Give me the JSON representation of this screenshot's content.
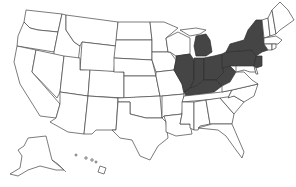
{
  "map": {
    "title": "United States",
    "highlight_color": "#454545",
    "outline_color": "#444444",
    "background": "#ffffff",
    "highlighted_states": [
      "Illinois",
      "Indiana",
      "Michigan",
      "Ohio",
      "Kentucky",
      "West Virginia",
      "Pennsylvania",
      "New York",
      "New Jersey"
    ],
    "states": [
      {
        "id": "WA",
        "name": "Washington",
        "highlighted": false
      },
      {
        "id": "OR",
        "name": "Oregon",
        "highlighted": false
      },
      {
        "id": "CA",
        "name": "California",
        "highlighted": false
      },
      {
        "id": "ID",
        "name": "Idaho",
        "highlighted": false
      },
      {
        "id": "NV",
        "name": "Nevada",
        "highlighted": false
      },
      {
        "id": "MT",
        "name": "Montana",
        "highlighted": false
      },
      {
        "id": "WY",
        "name": "Wyoming",
        "highlighted": false
      },
      {
        "id": "UT",
        "name": "Utah",
        "highlighted": false
      },
      {
        "id": "AZ",
        "name": "Arizona",
        "highlighted": false
      },
      {
        "id": "CO",
        "name": "Colorado",
        "highlighted": false
      },
      {
        "id": "NM",
        "name": "New Mexico",
        "highlighted": false
      },
      {
        "id": "ND",
        "name": "North Dakota",
        "highlighted": false
      },
      {
        "id": "SD",
        "name": "South Dakota",
        "highlighted": false
      },
      {
        "id": "NE",
        "name": "Nebraska",
        "highlighted": false
      },
      {
        "id": "KS",
        "name": "Kansas",
        "highlighted": false
      },
      {
        "id": "OK",
        "name": "Oklahoma",
        "highlighted": false
      },
      {
        "id": "TX",
        "name": "Texas",
        "highlighted": false
      },
      {
        "id": "MN",
        "name": "Minnesota",
        "highlighted": false
      },
      {
        "id": "IA",
        "name": "Iowa",
        "highlighted": false
      },
      {
        "id": "MO",
        "name": "Missouri",
        "highlighted": false
      },
      {
        "id": "AR",
        "name": "Arkansas",
        "highlighted": false
      },
      {
        "id": "LA",
        "name": "Louisiana",
        "highlighted": false
      },
      {
        "id": "WI",
        "name": "Wisconsin",
        "highlighted": false
      },
      {
        "id": "IL",
        "name": "Illinois",
        "highlighted": true
      },
      {
        "id": "MI",
        "name": "Michigan",
        "highlighted": true
      },
      {
        "id": "IN",
        "name": "Indiana",
        "highlighted": true
      },
      {
        "id": "OH",
        "name": "Ohio",
        "highlighted": true
      },
      {
        "id": "KY",
        "name": "Kentucky",
        "highlighted": true
      },
      {
        "id": "TN",
        "name": "Tennessee",
        "highlighted": false
      },
      {
        "id": "MS",
        "name": "Mississippi",
        "highlighted": false
      },
      {
        "id": "AL",
        "name": "Alabama",
        "highlighted": false
      },
      {
        "id": "GA",
        "name": "Georgia",
        "highlighted": false
      },
      {
        "id": "FL",
        "name": "Florida",
        "highlighted": false
      },
      {
        "id": "SC",
        "name": "South Carolina",
        "highlighted": false
      },
      {
        "id": "NC",
        "name": "North Carolina",
        "highlighted": false
      },
      {
        "id": "VA",
        "name": "Virginia",
        "highlighted": false
      },
      {
        "id": "WV",
        "name": "West Virginia",
        "highlighted": true
      },
      {
        "id": "PA",
        "name": "Pennsylvania",
        "highlighted": true
      },
      {
        "id": "NY",
        "name": "New York",
        "highlighted": true
      },
      {
        "id": "NJ",
        "name": "New Jersey",
        "highlighted": true
      },
      {
        "id": "MD",
        "name": "Maryland",
        "highlighted": false
      },
      {
        "id": "DE",
        "name": "Delaware",
        "highlighted": false
      },
      {
        "id": "VT",
        "name": "Vermont",
        "highlighted": false
      },
      {
        "id": "NH",
        "name": "New Hampshire",
        "highlighted": false
      },
      {
        "id": "ME",
        "name": "Maine",
        "highlighted": false
      },
      {
        "id": "MA",
        "name": "Massachusetts",
        "highlighted": false
      },
      {
        "id": "CT",
        "name": "Connecticut",
        "highlighted": false
      },
      {
        "id": "RI",
        "name": "Rhode Island",
        "highlighted": false
      },
      {
        "id": "AK",
        "name": "Alaska",
        "highlighted": false
      },
      {
        "id": "HI",
        "name": "Hawaii",
        "highlighted": false
      }
    ]
  }
}
